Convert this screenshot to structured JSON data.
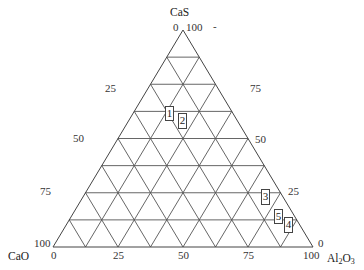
{
  "diagram": {
    "type": "ternary",
    "divisions": 8,
    "vertices": {
      "top": {
        "label": "CaS"
      },
      "left": {
        "label": "CaO"
      },
      "right": {
        "label_main": "Al",
        "label_sub1": "2",
        "label_mid": "O",
        "label_sub2": "3"
      }
    },
    "tick_labels": {
      "top_left_zero": "0",
      "top_right_hundred": "100",
      "stray_mark": "-",
      "left_side": [
        "25",
        "50",
        "75",
        "100"
      ],
      "right_side": [
        "75",
        "50",
        "25",
        "0"
      ],
      "bottom": [
        "0",
        "25",
        "50",
        "75",
        "100"
      ]
    },
    "points": [
      {
        "id": "1",
        "label": "1"
      },
      {
        "id": "2",
        "label": "2"
      },
      {
        "id": "3",
        "label": "3"
      },
      {
        "id": "4",
        "label": "4"
      },
      {
        "id": "5",
        "label": "5"
      }
    ]
  }
}
